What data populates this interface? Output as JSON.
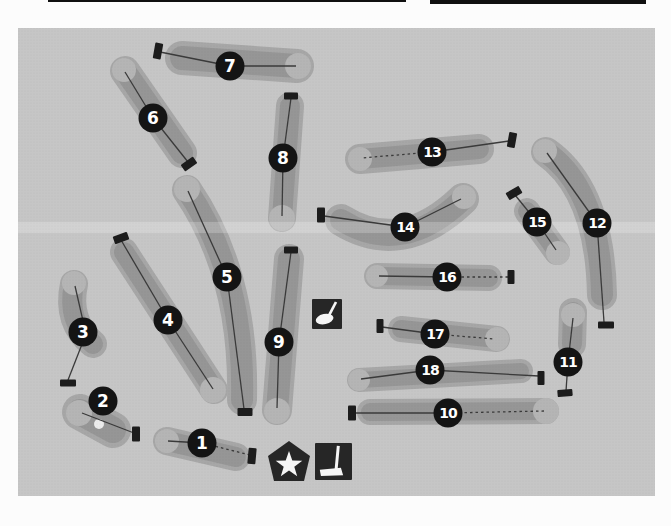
{
  "header": {
    "rules": [
      {
        "name": "page-rule-thin",
        "x": 48,
        "y": 0,
        "width": 358,
        "height": 2
      },
      {
        "name": "page-rule-thick",
        "x": 430,
        "y": 0,
        "width": 216,
        "height": 4
      }
    ],
    "rule_color": "#101010"
  },
  "map": {
    "frame": {
      "x": 18,
      "y": 28,
      "width": 637,
      "height": 468
    },
    "colors": {
      "page_background": "#fcfcfc",
      "map_background": "#c6c6c6",
      "rough": "#a7a7a7",
      "fairway": "#969696",
      "green": "#b5b5b5",
      "bunker": "#ececec",
      "hole_label_background": "#141414",
      "hole_label_text": "#ffffff",
      "tee_marker": "#1c1c1c",
      "route_line": "#3a3a3a",
      "icon_background": "#262626",
      "icon_glyph": "#f5f5f5",
      "scan_band": "rgba(255,255,255,0.22)"
    },
    "scan_band": {
      "x": 18,
      "y": 222,
      "width": 637,
      "height": 11
    },
    "holes": [
      {
        "number": "1",
        "label": {
          "x": 202,
          "y": 443
        },
        "fairway": {
          "path": "M167 441 L236 457",
          "width": 20,
          "rough_width": 28
        },
        "green": {
          "x": 167,
          "y": 441,
          "r": 12
        },
        "tee": {
          "x": 252,
          "y": 456,
          "w": 8,
          "h": 16,
          "angle": 5
        },
        "route": {
          "points": [
            [
              250,
              455
            ],
            [
              202,
              443
            ],
            [
              168,
              441
            ]
          ],
          "dashed": [
            1,
            0
          ]
        }
      },
      {
        "number": "2",
        "label": {
          "x": 103,
          "y": 401
        },
        "fairway": {
          "path": "M80 412 L113 430",
          "width": 26,
          "rough_width": 36
        },
        "green": {
          "x": 79,
          "y": 413,
          "r": 13
        },
        "tee": {
          "x": 136,
          "y": 434,
          "w": 8,
          "h": 15,
          "angle": 0
        },
        "route": {
          "points": [
            [
              134,
              433
            ],
            [
              82,
              413
            ]
          ],
          "dashed": [
            0
          ]
        },
        "bunker": {
          "x": 99,
          "y": 424,
          "r": 5
        }
      },
      {
        "number": "3",
        "label": {
          "x": 83,
          "y": 332
        },
        "fairway": {
          "path": "M74 284 Q66 322 93 344",
          "width": 20,
          "rough_width": 28
        },
        "green": {
          "x": 74,
          "y": 283,
          "r": 12
        },
        "tee": {
          "x": 68,
          "y": 383,
          "w": 16,
          "h": 7,
          "angle": 0
        },
        "route": {
          "points": [
            [
              68,
              380
            ],
            [
              86,
              334
            ],
            [
              75,
              286
            ]
          ],
          "dashed": [
            0,
            0
          ]
        }
      },
      {
        "number": "4",
        "label": {
          "x": 168,
          "y": 320
        },
        "fairway": {
          "path": "M124 252 L214 390",
          "width": 20,
          "rough_width": 28
        },
        "green": {
          "x": 213,
          "y": 390,
          "r": 13
        },
        "tee": {
          "x": 121,
          "y": 238,
          "w": 15,
          "h": 8,
          "angle": -20
        },
        "route": {
          "points": [
            [
              121,
              240
            ],
            [
              168,
              320
            ],
            [
              213,
              389
            ]
          ],
          "dashed": [
            0,
            0
          ]
        }
      },
      {
        "number": "5",
        "label": {
          "x": 227,
          "y": 277
        },
        "fairway": {
          "path": "M187 190 Q245 275 242 400",
          "width": 22,
          "rough_width": 30
        },
        "green": {
          "x": 187,
          "y": 189,
          "r": 13
        },
        "tee": {
          "x": 245,
          "y": 412,
          "w": 15,
          "h": 8,
          "angle": 0
        },
        "route": {
          "points": [
            [
              244,
              409
            ],
            [
              227,
              277
            ],
            [
              188,
              191
            ]
          ],
          "dashed": [
            0,
            0
          ]
        }
      },
      {
        "number": "6",
        "label": {
          "x": 153,
          "y": 118
        },
        "fairway": {
          "path": "M125 71 L182 153",
          "width": 22,
          "rough_width": 30
        },
        "green": {
          "x": 124,
          "y": 70,
          "r": 12
        },
        "tee": {
          "x": 189,
          "y": 164,
          "w": 15,
          "h": 8,
          "angle": -35
        },
        "route": {
          "points": [
            [
              188,
              162
            ],
            [
              153,
              118
            ],
            [
              125,
              72
            ]
          ],
          "dashed": [
            0,
            0
          ]
        }
      },
      {
        "number": "7",
        "label": {
          "x": 230,
          "y": 66
        },
        "fairway": {
          "path": "M182 58 L297 66",
          "width": 24,
          "rough_width": 34
        },
        "green": {
          "x": 298,
          "y": 66,
          "r": 13
        },
        "tee": {
          "x": 158,
          "y": 51,
          "w": 8,
          "h": 16,
          "angle": 10
        },
        "route": {
          "points": [
            [
              160,
              52
            ],
            [
              230,
              66
            ],
            [
              296,
              66
            ]
          ],
          "dashed": [
            0,
            0
          ]
        }
      },
      {
        "number": "8",
        "label": {
          "x": 283,
          "y": 158
        },
        "fairway": {
          "path": "M290 106 L282 218",
          "width": 20,
          "rough_width": 28
        },
        "green": {
          "x": 282,
          "y": 218,
          "r": 13
        },
        "tee": {
          "x": 291,
          "y": 96,
          "w": 14,
          "h": 7,
          "angle": 0
        },
        "route": {
          "points": [
            [
              291,
              98
            ],
            [
              283,
              158
            ],
            [
              282,
              216
            ]
          ],
          "dashed": [
            0,
            0
          ]
        }
      },
      {
        "number": "9",
        "label": {
          "x": 279,
          "y": 342
        },
        "fairway": {
          "path": "M289 259 L277 410",
          "width": 22,
          "rough_width": 30
        },
        "green": {
          "x": 277,
          "y": 411,
          "r": 13
        },
        "tee": {
          "x": 291,
          "y": 250,
          "w": 14,
          "h": 7,
          "angle": 0
        },
        "route": {
          "points": [
            [
              291,
              252
            ],
            [
              279,
              342
            ],
            [
              277,
              408
            ]
          ],
          "dashed": [
            0,
            0
          ]
        }
      },
      {
        "number": "10",
        "label": {
          "x": 448,
          "y": 413
        },
        "fairway": {
          "path": "M370 412 L546 411",
          "width": 18,
          "rough_width": 26
        },
        "green": {
          "x": 546,
          "y": 411,
          "r": 13
        },
        "tee": {
          "x": 352,
          "y": 413,
          "w": 8,
          "h": 15,
          "angle": 0
        },
        "route": {
          "points": [
            [
              354,
              413
            ],
            [
              448,
              413
            ],
            [
              544,
              411
            ]
          ],
          "dashed": [
            0,
            1
          ]
        }
      },
      {
        "number": "11",
        "label": {
          "x": 568,
          "y": 362
        },
        "fairway": {
          "path": "M573 312 L572 344",
          "width": 20,
          "rough_width": 28
        },
        "green": {
          "x": 573,
          "y": 315,
          "r": 12
        },
        "tee": {
          "x": 565,
          "y": 393,
          "w": 15,
          "h": 7,
          "angle": -5
        },
        "route": {
          "points": [
            [
              566,
              391
            ],
            [
              568,
              362
            ],
            [
              573,
              318
            ]
          ],
          "dashed": [
            0,
            0
          ]
        }
      },
      {
        "number": "12",
        "label": {
          "x": 597,
          "y": 223
        },
        "fairway": {
          "path": "M546 152 Q600 190 602 295",
          "width": 22,
          "rough_width": 30
        },
        "green": {
          "x": 545,
          "y": 151,
          "r": 12
        },
        "tee": {
          "x": 606,
          "y": 325,
          "w": 16,
          "h": 7,
          "angle": 0
        },
        "route": {
          "points": [
            [
              604,
              322
            ],
            [
              597,
              223
            ],
            [
              547,
              153
            ]
          ],
          "dashed": [
            0,
            0
          ]
        }
      },
      {
        "number": "13",
        "label": {
          "x": 432,
          "y": 152
        },
        "fairway": {
          "path": "M360 159 L479 149",
          "width": 20,
          "rough_width": 30
        },
        "green": {
          "x": 360,
          "y": 159,
          "r": 12
        },
        "tee": {
          "x": 512,
          "y": 140,
          "w": 8,
          "h": 15,
          "angle": 10
        },
        "route": {
          "points": [
            [
              509,
              141
            ],
            [
              432,
              152
            ],
            [
              362,
              158
            ]
          ],
          "dashed": [
            0,
            1
          ]
        }
      },
      {
        "number": "14",
        "label": {
          "x": 405,
          "y": 227
        },
        "fairway": {
          "path": "M341 220 Q402 258 463 199",
          "width": 22,
          "rough_width": 32
        },
        "green": {
          "x": 464,
          "y": 197,
          "r": 12
        },
        "tee": {
          "x": 321,
          "y": 215,
          "w": 8,
          "h": 15,
          "angle": 0
        },
        "route": {
          "points": [
            [
              324,
              216
            ],
            [
              405,
              227
            ],
            [
              461,
              199
            ]
          ],
          "dashed": [
            0,
            0
          ]
        }
      },
      {
        "number": "15",
        "label": {
          "x": 537,
          "y": 222
        },
        "fairway": {
          "path": "M527 211 L557 252",
          "width": 18,
          "rough_width": 26
        },
        "green": {
          "x": 558,
          "y": 253,
          "r": 12
        },
        "tee": {
          "x": 514,
          "y": 193,
          "w": 15,
          "h": 8,
          "angle": -30
        },
        "route": {
          "points": [
            [
              515,
              195
            ],
            [
              537,
              222
            ],
            [
              556,
              250
            ]
          ],
          "dashed": [
            0,
            0
          ]
        }
      },
      {
        "number": "16",
        "label": {
          "x": 447,
          "y": 277
        },
        "fairway": {
          "path": "M377 276 L489 278",
          "width": 18,
          "rough_width": 26
        },
        "green": {
          "x": 377,
          "y": 276,
          "r": 11
        },
        "tee": {
          "x": 511,
          "y": 277,
          "w": 7,
          "h": 14,
          "angle": 0
        },
        "route": {
          "points": [
            [
              508,
              277
            ],
            [
              447,
              277
            ],
            [
              379,
              276
            ]
          ],
          "dashed": [
            1,
            0
          ]
        }
      },
      {
        "number": "17",
        "label": {
          "x": 435,
          "y": 334
        },
        "fairway": {
          "path": "M401 329 L497 339",
          "width": 18,
          "rough_width": 26
        },
        "green": {
          "x": 497,
          "y": 339,
          "r": 12
        },
        "tee": {
          "x": 380,
          "y": 326,
          "w": 7,
          "h": 14,
          "angle": 0
        },
        "route": {
          "points": [
            [
              382,
              327
            ],
            [
              435,
              334
            ],
            [
              494,
              339
            ]
          ],
          "dashed": [
            0,
            1
          ]
        }
      },
      {
        "number": "18",
        "label": {
          "x": 430,
          "y": 370
        },
        "fairway": {
          "path": "M359 380 L521 371",
          "width": 16,
          "rough_width": 24
        },
        "green": {
          "x": 359,
          "y": 380,
          "r": 11
        },
        "tee": {
          "x": 541,
          "y": 378,
          "w": 7,
          "h": 14,
          "angle": 0
        },
        "route": {
          "points": [
            [
              539,
              376
            ],
            [
              430,
              370
            ],
            [
              361,
              379
            ]
          ],
          "dashed": [
            0,
            0
          ]
        }
      }
    ],
    "icons": [
      {
        "name": "golf-club-icon",
        "shape": "square",
        "glyph": "wood-club",
        "x": 312,
        "y": 299,
        "size": 30
      },
      {
        "name": "clubhouse-star-icon",
        "shape": "pentagon",
        "glyph": "star",
        "points": "289,441 310,456 304,481 274,481 268,456",
        "star": {
          "cx": 289,
          "cy": 465,
          "outer_r": 14,
          "inner_r": 5.6
        }
      },
      {
        "name": "putter-icon",
        "shape": "square",
        "glyph": "putter",
        "x": 315,
        "y": 443,
        "size": 37
      }
    ]
  }
}
